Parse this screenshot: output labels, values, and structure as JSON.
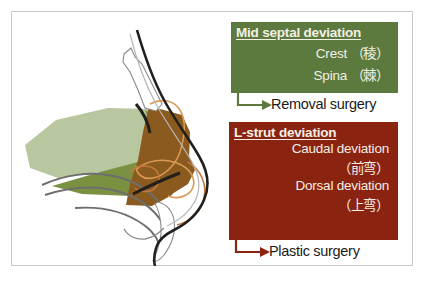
{
  "figure": {
    "background_color": "#ffffff",
    "border_color": "#c9c9c9"
  },
  "illustration": {
    "name": "lateral-nose-anatomy-diagram",
    "description": "Lateral (profile) view of the nose showing the nasal septum divided into a mid septal region and an L-strut region",
    "regions": [
      {
        "name": "mid-septal-region-light",
        "label": "Mid septal cartilage / perpendicular plate",
        "color": "#b9c7a0"
      },
      {
        "name": "mid-septal-region-dark",
        "label": "Mid septal vomer / maxillary crest",
        "color": "#7a9142"
      },
      {
        "name": "l-strut-region",
        "label": "L-strut (dorsal and caudal struts)",
        "color": "#8a5a1e"
      },
      {
        "name": "cartilage-outline",
        "label": "Lower lateral cartilage outline",
        "color": "#d89a55"
      },
      {
        "name": "skin-profile",
        "label": "Skin profile line",
        "color": "#231f1c"
      },
      {
        "name": "bone-outline",
        "label": "Nasal bone / turbinate outline",
        "color": "#6e6e6e"
      }
    ]
  },
  "panels": [
    {
      "id": "mid-septal",
      "title": "Mid septal deviation",
      "background_color": "#5c7a3d",
      "text_color": "#f2efe4",
      "lines": [
        "Crest （稜）",
        "Spina （棘）"
      ],
      "arrow": {
        "name": "elbow-arrow-removal",
        "color": "#5c7a3d"
      },
      "outcome": "Removal surgery",
      "outcome_color": "#1a1a1a"
    },
    {
      "id": "l-strut",
      "title": "L-strut deviation",
      "background_color": "#8a2310",
      "text_color": "#f2efe4",
      "lines": [
        "Caudal deviation",
        "（前弯）",
        "Dorsal deviation",
        "（上弯）"
      ],
      "arrow": {
        "name": "elbow-arrow-plastic",
        "color": "#8a2310"
      },
      "outcome": "Plastic surgery",
      "outcome_color": "#1a1a1a"
    }
  ]
}
